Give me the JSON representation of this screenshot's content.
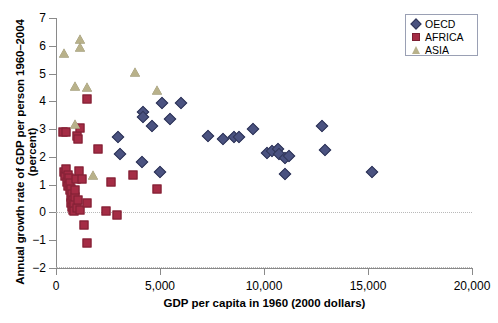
{
  "chart_data": {
    "type": "scatter",
    "title": "",
    "xlabel": "GDP per capita in 1960 (2000 dollars)",
    "ylabel": "Annual growth rate of GDP per person 1960–2004 (percent)",
    "xlim": [
      0,
      20000
    ],
    "ylim": [
      -2,
      7
    ],
    "xticks": [
      0,
      5000,
      10000,
      15000,
      20000
    ],
    "xtick_labels": [
      "0",
      "5,000",
      "10,000",
      "15,000",
      "20,000"
    ],
    "yticks": [
      -2,
      -1,
      0,
      1,
      2,
      3,
      4,
      5,
      6,
      7
    ],
    "ytick_labels": [
      "−2",
      "−1",
      "0",
      "1",
      "2",
      "3",
      "4",
      "5",
      "6",
      "7"
    ],
    "grid": false,
    "zero_reference_line": true,
    "legend_position": "top-right",
    "series": [
      {
        "name": "OECD",
        "marker": "diamond",
        "color": "#4a5280",
        "points": [
          [
            2980,
            2.7
          ],
          [
            3060,
            2.1
          ],
          [
            4180,
            3.6
          ],
          [
            4180,
            3.45
          ],
          [
            4620,
            3.1
          ],
          [
            5120,
            3.95
          ],
          [
            5480,
            3.35
          ],
          [
            6000,
            3.95
          ],
          [
            4150,
            1.8
          ],
          [
            5000,
            1.45
          ],
          [
            7300,
            2.75
          ],
          [
            8050,
            2.65
          ],
          [
            8550,
            2.7
          ],
          [
            8800,
            2.7
          ],
          [
            9450,
            3.0
          ],
          [
            10150,
            2.15
          ],
          [
            10400,
            2.2
          ],
          [
            10650,
            2.3
          ],
          [
            10700,
            2.1
          ],
          [
            11000,
            1.95
          ],
          [
            11200,
            2.05
          ],
          [
            11000,
            1.4
          ],
          [
            12800,
            3.1
          ],
          [
            12950,
            2.25
          ],
          [
            15200,
            1.45
          ]
        ]
      },
      {
        "name": "AFRICA",
        "marker": "square",
        "color": "#a52c45",
        "points": [
          [
            350,
            2.9
          ],
          [
            480,
            2.9
          ],
          [
            1000,
            2.75
          ],
          [
            1050,
            2.65
          ],
          [
            1150,
            3.05
          ],
          [
            1500,
            4.1
          ],
          [
            2000,
            2.3
          ],
          [
            400,
            1.45
          ],
          [
            430,
            1.3
          ],
          [
            500,
            1.55
          ],
          [
            520,
            1.1
          ],
          [
            560,
            1.35
          ],
          [
            600,
            0.95
          ],
          [
            620,
            1.25
          ],
          [
            650,
            0.8
          ],
          [
            680,
            1.05
          ],
          [
            700,
            0.55
          ],
          [
            720,
            0.85
          ],
          [
            740,
            0.35
          ],
          [
            760,
            0.65
          ],
          [
            780,
            0.2
          ],
          [
            800,
            0.45
          ],
          [
            820,
            0.1
          ],
          [
            850,
            0.3
          ],
          [
            880,
            0.05
          ],
          [
            900,
            0.55
          ],
          [
            920,
            0.8
          ],
          [
            940,
            1.2
          ],
          [
            1000,
            0.15
          ],
          [
            1050,
            0.45
          ],
          [
            1100,
            1.5
          ],
          [
            1150,
            0.1
          ],
          [
            1250,
            1.2
          ],
          [
            1500,
            0.35
          ],
          [
            1350,
            -0.45
          ],
          [
            1500,
            -1.1
          ],
          [
            2650,
            1.1
          ],
          [
            3700,
            1.35
          ],
          [
            4850,
            0.85
          ],
          [
            2400,
            0.05
          ],
          [
            2950,
            -0.1
          ]
        ]
      },
      {
        "name": "ASIA",
        "marker": "triangle",
        "color": "#b8b18a",
        "points": [
          [
            400,
            5.75
          ],
          [
            1150,
            6.25
          ],
          [
            1150,
            5.95
          ],
          [
            900,
            4.55
          ],
          [
            1500,
            4.5
          ],
          [
            3800,
            5.05
          ],
          [
            4850,
            4.4
          ],
          [
            900,
            3.2
          ],
          [
            1800,
            1.35
          ]
        ]
      }
    ]
  },
  "legend": {
    "items": [
      {
        "label": "OECD",
        "marker": "diamond",
        "color": "#4a5280"
      },
      {
        "label": "AFRICA",
        "marker": "square",
        "color": "#a52c45"
      },
      {
        "label": "ASIA",
        "marker": "triangle",
        "color": "#b8b18a"
      }
    ]
  }
}
